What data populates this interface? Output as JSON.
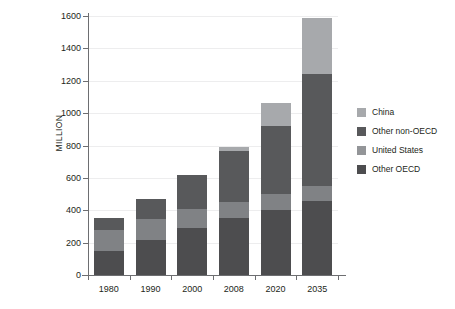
{
  "chart_data": {
    "type": "bar",
    "stacked": true,
    "title": "",
    "subtitle": "",
    "xlabel": "",
    "ylabel": "MILLION",
    "categories": [
      "1980",
      "1990",
      "2000",
      "2008",
      "2020",
      "2035"
    ],
    "ylim": [
      0,
      1600
    ],
    "yticks": [
      0,
      200,
      400,
      600,
      800,
      1000,
      1200,
      1400,
      1600
    ],
    "ytick_labels": [
      "0",
      "200",
      "400",
      "600",
      "800",
      "1000",
      "1200",
      "1400",
      "1600"
    ],
    "grid": true,
    "legend_position": "right",
    "series": [
      {
        "name": "Other OECD",
        "color": "#4d4d4f",
        "values": [
          150,
          215,
          290,
          350,
          400,
          460
        ]
      },
      {
        "name": "United States",
        "color": "#808285",
        "values": [
          130,
          130,
          120,
          100,
          100,
          90
        ]
      },
      {
        "name": "Other non-OECD",
        "color": "#58595b",
        "values": [
          75,
          125,
          210,
          315,
          420,
          690
        ]
      },
      {
        "name": "China",
        "color": "#a7a9ac",
        "values": [
          0,
          0,
          0,
          25,
          140,
          350
        ]
      }
    ],
    "totals": [
      355,
      470,
      620,
      790,
      1060,
      1590
    ],
    "stack_order": [
      "Other OECD",
      "United States",
      "Other non-OECD",
      "China"
    ]
  },
  "legend": {
    "items": [
      {
        "label": "China",
        "color": "#a7a9ac"
      },
      {
        "label": "Other non-OECD",
        "color": "#58595b"
      },
      {
        "label": "United States",
        "color": "#808285",
        "swatch_color": "#939598"
      },
      {
        "label": "Other OECD",
        "color": "#4d4d4f"
      }
    ]
  },
  "axes": {
    "y_title": "MILLION",
    "axis_color": "#6d6e71",
    "grid_color": "#ededee"
  }
}
